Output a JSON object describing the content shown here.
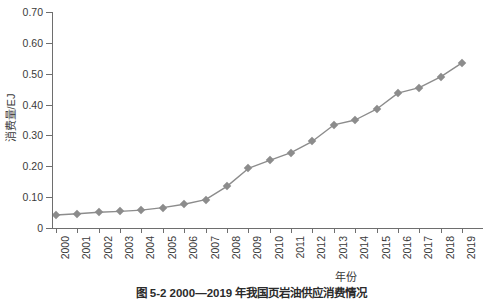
{
  "chart_data": {
    "type": "line",
    "title": "",
    "xlabel": "年份",
    "ylabel": "消费量/EJ",
    "categories": [
      "2000",
      "2001",
      "2002",
      "2003",
      "2004",
      "2005",
      "2006",
      "2007",
      "2008",
      "2009",
      "2010",
      "2011",
      "2012",
      "2013",
      "2014",
      "2015",
      "2016",
      "2017",
      "2018",
      "2019"
    ],
    "values": [
      0.042,
      0.046,
      0.051,
      0.054,
      0.058,
      0.066,
      0.077,
      0.092,
      0.135,
      0.193,
      0.219,
      0.244,
      0.281,
      0.334,
      0.35,
      0.385,
      0.437,
      0.455,
      0.49,
      0.535
    ],
    "series": [
      {
        "name": "消费量",
        "values": [
          0.042,
          0.046,
          0.051,
          0.054,
          0.058,
          0.066,
          0.077,
          0.092,
          0.135,
          0.193,
          0.219,
          0.244,
          0.281,
          0.334,
          0.35,
          0.385,
          0.437,
          0.455,
          0.49,
          0.535
        ]
      }
    ],
    "ylim": [
      0,
      0.7
    ],
    "ytick_values": [
      0,
      0.1,
      0.2,
      0.3,
      0.4,
      0.5,
      0.6,
      0.7
    ],
    "ytick_labels": [
      "0",
      "0.10",
      "0.20",
      "0.30",
      "0.40",
      "0.50",
      "0.60",
      "0.70"
    ],
    "grid": false,
    "legend": "none",
    "line_color": "#8c8c8c",
    "marker_color": "#8c8c8c",
    "marker": "diamond",
    "axis_color": "#6e6e6e"
  },
  "caption": {
    "text": "图 5-2  2000—2019 年我国页岩油供应消费情况"
  }
}
